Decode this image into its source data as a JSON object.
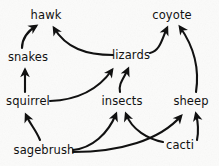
{
  "diagram": {
    "type": "food-web",
    "background_color": "#fbfbfa",
    "ink_color": "#111111",
    "nodes": [
      {
        "id": "hawk",
        "label": "hawk",
        "x": 46,
        "y": 15
      },
      {
        "id": "coyote",
        "label": "coyote",
        "x": 172,
        "y": 15
      },
      {
        "id": "snakes",
        "label": "snakes",
        "x": 28,
        "y": 57
      },
      {
        "id": "lizards",
        "label": "lizards",
        "x": 131,
        "y": 55
      },
      {
        "id": "squirrel",
        "label": "squirrel",
        "x": 28,
        "y": 101
      },
      {
        "id": "insects",
        "label": "insects",
        "x": 122,
        "y": 101
      },
      {
        "id": "sheep",
        "label": "sheep",
        "x": 191,
        "y": 101
      },
      {
        "id": "sagebrush",
        "label": "sagebrush",
        "x": 44,
        "y": 150
      },
      {
        "id": "cacti",
        "label": "cacti",
        "x": 180,
        "y": 145
      }
    ],
    "edges": [
      {
        "from": "snakes",
        "to": "hawk",
        "label": "snakes eaten by hawk"
      },
      {
        "from": "lizards",
        "to": "hawk",
        "label": "lizards eaten by hawk"
      },
      {
        "from": "lizards",
        "to": "coyote",
        "label": "lizards eaten by coyote"
      },
      {
        "from": "sheep",
        "to": "coyote",
        "label": "sheep eaten by coyote"
      },
      {
        "from": "squirrel",
        "to": "snakes",
        "label": "squirrel eaten by snakes"
      },
      {
        "from": "squirrel",
        "to": "lizards",
        "label": "squirrel eaten by lizards"
      },
      {
        "from": "insects",
        "to": "lizards",
        "label": "insects eaten by lizards"
      },
      {
        "from": "sagebrush",
        "to": "squirrel",
        "label": "sagebrush eaten by squirrel"
      },
      {
        "from": "sagebrush",
        "to": "insects",
        "label": "sagebrush eaten by insects"
      },
      {
        "from": "sagebrush",
        "to": "sheep",
        "label": "sagebrush eaten by sheep"
      },
      {
        "from": "cacti",
        "to": "insects",
        "label": "cacti eaten by insects"
      },
      {
        "from": "cacti",
        "to": "sheep",
        "label": "cacti eaten by sheep"
      }
    ]
  }
}
